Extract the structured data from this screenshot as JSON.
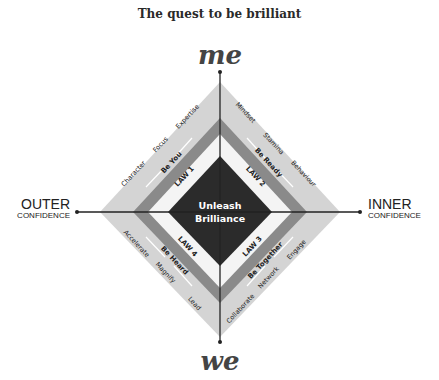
{
  "title": "The quest to be brilliant",
  "axis_labels": {
    "top": "me",
    "bottom": "we",
    "left": {
      "main": "OUTER",
      "sub": "CONFIDENCE"
    },
    "right": {
      "main": "INNER",
      "sub": "CONFIDENCE"
    }
  },
  "center": {
    "line1": "Unleash",
    "line2": "Brilliance"
  },
  "quadrants": [
    {
      "law": "LAW 1",
      "theme": "Be You",
      "qualities": [
        "Character",
        "Focus",
        "Expertise"
      ]
    },
    {
      "law": "LAW 2",
      "theme": "Be Ready",
      "qualities": [
        "Mindset",
        "Stamina",
        "Behaviour"
      ]
    },
    {
      "law": "LAW 3",
      "theme": "Be Together",
      "qualities": [
        "Collaborate",
        "Network",
        "Engage"
      ]
    },
    {
      "law": "LAW 4",
      "theme": "Be Heard",
      "qualities": [
        "Accelerate",
        "Magnify",
        "Lead"
      ]
    }
  ],
  "colors": {
    "outer_band": "#d4d4d4",
    "middle_band": "#8a8a8a",
    "law_band": "#f4f4f4",
    "core": "#2b2b2b",
    "axis": "#222222"
  }
}
